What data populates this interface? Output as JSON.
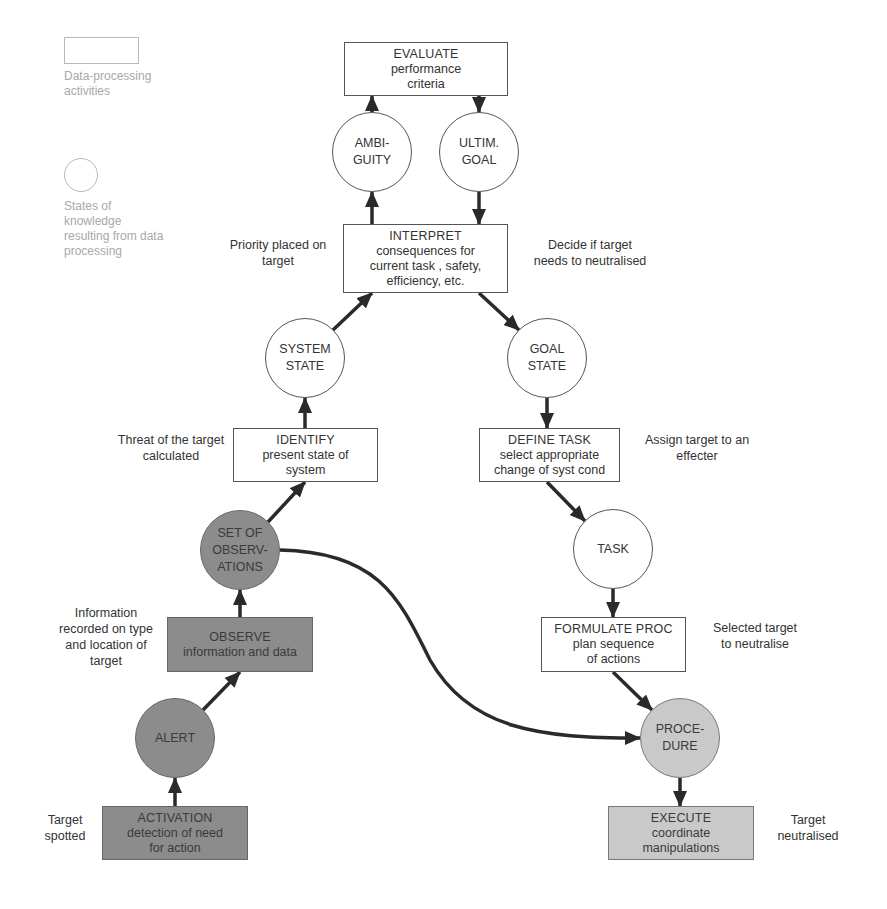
{
  "legend": {
    "box_label": "Data-processing\nactivities",
    "circle_label": "States of\nknowledge\nresulting from data\nprocessing"
  },
  "colors": {
    "dark_fill": "#8c8c8c",
    "light_fill": "#c9c9c9",
    "white_fill": "#ffffff",
    "line": "#333333",
    "legend_text": "#a8a8a8"
  },
  "boxes": {
    "evaluate": {
      "title": "EVALUATE",
      "line1": "performance",
      "line2": "criteria"
    },
    "interpret": {
      "title": "INTERPRET",
      "line1": "consequences for",
      "line2": "current task , safety,",
      "line3": "efficiency, etc."
    },
    "identify": {
      "title": "IDENTIFY",
      "line1": "present state of",
      "line2": "system"
    },
    "define_task": {
      "title": "DEFINE TASK",
      "line1": "select appropriate",
      "line2": "change of syst cond"
    },
    "observe": {
      "title": "OBSERVE",
      "line1": "information and data"
    },
    "formulate_proc": {
      "title": "FORMULATE PROC",
      "line1": "plan sequence",
      "line2": "of actions"
    },
    "activation": {
      "title": "ACTIVATION",
      "line1": "detection of need",
      "line2": "for action"
    },
    "execute": {
      "title": "EXECUTE",
      "line1": "coordinate",
      "line2": "manipulations"
    }
  },
  "circles": {
    "ambiguity": {
      "line1": "AMBI-",
      "line2": "GUITY"
    },
    "ultim_goal": {
      "line1": "ULTIM.",
      "line2": "GOAL"
    },
    "system_state": {
      "line1": "SYSTEM",
      "line2": "STATE"
    },
    "goal_state": {
      "line1": "GOAL",
      "line2": "STATE"
    },
    "set_of_observations": {
      "line1": "SET OF",
      "line2": "OBSERV-",
      "line3": "ATIONS"
    },
    "task": {
      "line1": "TASK"
    },
    "alert": {
      "line1": "ALERT"
    },
    "procedure": {
      "line1": "PROCE-",
      "line2": "DURE"
    }
  },
  "annotations": {
    "priority": "Priority placed on\ntarget",
    "decide": "Decide if target\nneeds to neutralised",
    "threat": "Threat of the target\ncalculated",
    "assign": "Assign target to an\neffecter",
    "information": "Information\nrecorded on type\nand location of\ntarget",
    "selected": "Selected target\nto neutralise",
    "spotted": "Target\nspotted",
    "neutralised": "Target\nneutralised"
  }
}
